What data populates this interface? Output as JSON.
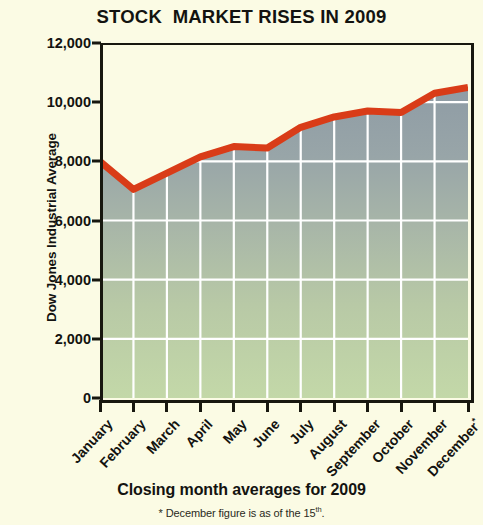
{
  "chart_data": {
    "type": "area",
    "title": "STOCK  MARKET RISES IN 2009",
    "xlabel": "",
    "ylabel": "Dow Jones Industrial Average",
    "categories": [
      "January",
      "February",
      "March",
      "April",
      "May",
      "June",
      "July",
      "August",
      "September",
      "October",
      "November",
      "December*"
    ],
    "values": [
      8000,
      7050,
      7600,
      8150,
      8500,
      8450,
      9150,
      9500,
      9700,
      9650,
      10300,
      10500
    ],
    "series": [
      {
        "name": "Dow Jones Industrial Average",
        "values": [
          8000,
          7050,
          7600,
          8150,
          8500,
          8450,
          9150,
          9500,
          9700,
          9650,
          10300,
          10500
        ]
      }
    ],
    "ylim": [
      0,
      12000
    ],
    "ytick_labels": [
      "12,000",
      "10,000",
      "8,000",
      "6,000",
      "4,000",
      "2,000",
      "0"
    ],
    "ytick_values": [
      12000,
      10000,
      8000,
      6000,
      4000,
      2000,
      0
    ],
    "grid": true,
    "grid_color": "#ffffff",
    "legend": "none",
    "line_color": "#d93c18",
    "area_top_color": "#93a0a8",
    "area_bottom_color": "#bcd4a6",
    "background_color": "#fbfbe4",
    "axis_color": "#17170f",
    "annotations": [
      "Closing month averages for 2009",
      "* December figure is as of the 15th."
    ]
  },
  "footer": {
    "caption": "Closing month averages for 2009",
    "note_prefix": "* December figure is as of the 15",
    "note_sup": "th",
    "note_suffix": "."
  }
}
